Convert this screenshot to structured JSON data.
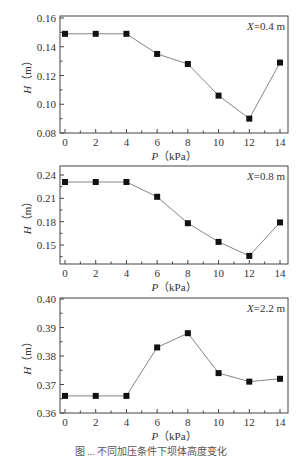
{
  "figure": {
    "width": 302,
    "height": 457,
    "caption": "图 ... 不同加压条件下坝体高度变化"
  },
  "chart_data": [
    {
      "type": "line",
      "title": "",
      "annotation": "X=0.4 m",
      "annotation_var": "X",
      "annotation_rest": "=0.4 m",
      "xlabel": "P（kPa）",
      "xlabel_var": "P",
      "xlabel_unit": "（kPa）",
      "ylabel": "H（m）",
      "ylabel_var": "H",
      "ylabel_unit": "（m）",
      "x": [
        0,
        2,
        4,
        6,
        8,
        10,
        12,
        14
      ],
      "series": [
        {
          "name": "H",
          "values": [
            0.149,
            0.149,
            0.149,
            0.135,
            0.128,
            0.106,
            0.09,
            0.129
          ],
          "marker": "square",
          "color": "#111111"
        }
      ],
      "xlim": [
        -0.5,
        14.5
      ],
      "ylim": [
        0.08,
        0.16
      ],
      "xticks": [
        0,
        2,
        4,
        6,
        8,
        10,
        12,
        14
      ],
      "yticks": [
        0.08,
        0.1,
        0.12,
        0.14,
        0.16
      ],
      "ytick_labels": [
        "0.08",
        "0.10",
        "0.12",
        "0.14",
        "0.16"
      ],
      "grid": false,
      "legend": "none"
    },
    {
      "type": "line",
      "title": "",
      "annotation": "X=0.8 m",
      "annotation_var": "X",
      "annotation_rest": "=0.8 m",
      "xlabel": "P（kPa）",
      "xlabel_var": "P",
      "xlabel_unit": "（kPa）",
      "ylabel": "H（m）",
      "ylabel_var": "H",
      "ylabel_unit": "（m）",
      "x": [
        0,
        2,
        4,
        6,
        8,
        10,
        12,
        14
      ],
      "series": [
        {
          "name": "H",
          "values": [
            0.231,
            0.231,
            0.231,
            0.212,
            0.178,
            0.154,
            0.136,
            0.179
          ],
          "marker": "square",
          "color": "#111111"
        }
      ],
      "xlim": [
        -0.5,
        14.5
      ],
      "ylim": [
        0.126,
        0.249
      ],
      "xticks": [
        0,
        2,
        4,
        6,
        8,
        10,
        12,
        14
      ],
      "yticks": [
        0.15,
        0.18,
        0.21,
        0.24
      ],
      "ytick_labels": [
        "0.15",
        "0.18",
        "0.21",
        "0.24"
      ],
      "grid": false,
      "legend": "none"
    },
    {
      "type": "line",
      "title": "",
      "annotation": "X=2.2 m",
      "annotation_var": "X",
      "annotation_rest": "=2.2 m",
      "xlabel": "P（kPa）",
      "xlabel_var": "P",
      "xlabel_unit": "（kPa）",
      "ylabel": "H（m）",
      "ylabel_var": "H",
      "ylabel_unit": "（m）",
      "x": [
        0,
        2,
        4,
        6,
        8,
        10,
        12,
        14
      ],
      "series": [
        {
          "name": "H",
          "values": [
            0.366,
            0.366,
            0.366,
            0.383,
            0.388,
            0.374,
            0.371,
            0.372
          ],
          "marker": "square",
          "color": "#111111"
        }
      ],
      "xlim": [
        -0.5,
        14.5
      ],
      "ylim": [
        0.36,
        0.4
      ],
      "xticks": [
        0,
        2,
        4,
        6,
        8,
        10,
        12,
        14
      ],
      "yticks": [
        0.36,
        0.37,
        0.38,
        0.39,
        0.4
      ],
      "ytick_labels": [
        "0.36",
        "0.37",
        "0.38",
        "0.39",
        "0.40"
      ],
      "grid": false,
      "legend": "none"
    }
  ],
  "layout": {
    "panels": [
      {
        "left": 60,
        "right": 288,
        "top": 16,
        "bottom": 133,
        "ylim_px": [
          133,
          18
        ]
      },
      {
        "left": 60,
        "right": 288,
        "top": 166,
        "bottom": 264,
        "ylim_px": [
          264,
          166
        ]
      },
      {
        "left": 60,
        "right": 288,
        "top": 298,
        "bottom": 413,
        "ylim_px": [
          413,
          299
        ]
      }
    ],
    "x0_px": 65,
    "x14_px": 280
  }
}
